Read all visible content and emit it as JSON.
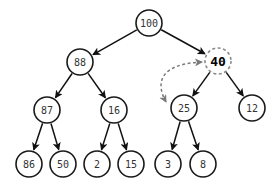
{
  "diagram": {
    "type": "binary-heap-tree",
    "colors": {
      "edge": "#111111",
      "node_stroke": "#1a1a1a",
      "highlight_stroke": "#8a8a8a",
      "swap_arrow": "#7a7a7a"
    },
    "nodes": [
      {
        "id": "n100",
        "label": "100",
        "x": 149,
        "y": 23
      },
      {
        "id": "n88",
        "label": "88",
        "x": 80,
        "y": 62
      },
      {
        "id": "n40",
        "label": "40",
        "x": 218,
        "y": 61,
        "highlight": true
      },
      {
        "id": "n87",
        "label": "87",
        "x": 47,
        "y": 110
      },
      {
        "id": "n16",
        "label": "16",
        "x": 114,
        "y": 110
      },
      {
        "id": "n25",
        "label": "25",
        "x": 184,
        "y": 108
      },
      {
        "id": "n12",
        "label": "12",
        "x": 252,
        "y": 108
      },
      {
        "id": "n86",
        "label": "86",
        "x": 29,
        "y": 164
      },
      {
        "id": "n50",
        "label": "50",
        "x": 63,
        "y": 164
      },
      {
        "id": "n2",
        "label": "2",
        "x": 97,
        "y": 164
      },
      {
        "id": "n15",
        "label": "15",
        "x": 131,
        "y": 164
      },
      {
        "id": "n3",
        "label": "3",
        "x": 168,
        "y": 164
      },
      {
        "id": "n8",
        "label": "8",
        "x": 203,
        "y": 164
      }
    ],
    "edges": [
      [
        "n100",
        "n88"
      ],
      [
        "n100",
        "n40"
      ],
      [
        "n88",
        "n87"
      ],
      [
        "n88",
        "n16"
      ],
      [
        "n40",
        "n25"
      ],
      [
        "n40",
        "n12"
      ],
      [
        "n87",
        "n86"
      ],
      [
        "n87",
        "n50"
      ],
      [
        "n16",
        "n2"
      ],
      [
        "n16",
        "n15"
      ],
      [
        "n25",
        "n3"
      ],
      [
        "n25",
        "n8"
      ]
    ],
    "swap": {
      "from": "n25",
      "to": "n40",
      "style": "dashed-bidirectional"
    }
  }
}
